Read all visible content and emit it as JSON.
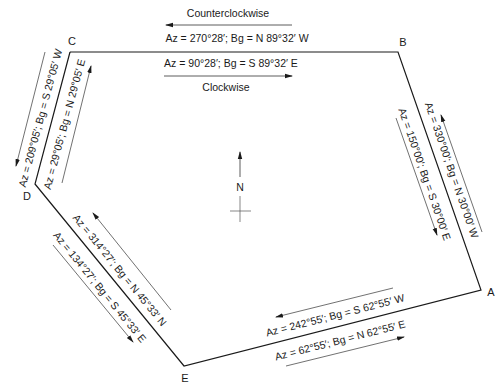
{
  "figure": {
    "type": "traverse-diagram"
  },
  "vertices": {
    "A": {
      "label": "A"
    },
    "B": {
      "label": "B"
    },
    "C": {
      "label": "C"
    },
    "D": {
      "label": "D"
    },
    "E": {
      "label": "E"
    }
  },
  "north_arrow": {
    "label": "N"
  },
  "directions": {
    "counterclockwise": "Counterclockwise",
    "clockwise": "Clockwise"
  },
  "lines": {
    "CB": {
      "counterclockwise": "Az = 270°28′; Bg = N 89°32′ W",
      "clockwise": "Az = 90°28′; Bg = S 89°32′ E"
    },
    "BA": {
      "counterclockwise": "Az = 330°00′; Bg = N 30°00′ W",
      "clockwise": "Az = 150°00′; Bg = S 30°00′ E"
    },
    "AE": {
      "counterclockwise": "Az = 242°55′; Bg = S 62°55′ W",
      "clockwise": "Az = 62°55′; Bg = N 62°55′ E"
    },
    "ED": {
      "counterclockwise": "Az = 314°27′; Bg = N 45°33′ N",
      "clockwise": "Az = 134°27′; Bg = S 45°33′ E"
    },
    "DC": {
      "counterclockwise": "Az = 209°05′; Bg = S 29°05′ W",
      "clockwise": "Az = 29°05′; Bg = N 29°05′ E"
    }
  },
  "colors": {
    "line": "#1a1a1a",
    "arrow": "#333333",
    "background": "#ffffff"
  }
}
